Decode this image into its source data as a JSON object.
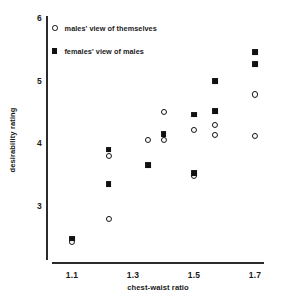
{
  "chart_data": {
    "type": "scatter",
    "title": "",
    "xlabel": "chest-waist ratio",
    "ylabel": "desirability rating",
    "xlim": [
      1.02,
      1.79
    ],
    "ylim": [
      2.1,
      6.0
    ],
    "xticks": [
      "1.1",
      "1.3",
      "1.5",
      "1.7"
    ],
    "xtick_values": [
      1.1,
      1.3,
      1.5,
      1.7
    ],
    "yticks": [
      "3",
      "4",
      "5",
      "6"
    ],
    "ytick_values": [
      3,
      4,
      5,
      6
    ],
    "grid": false,
    "legend_position": "top-left",
    "series": [
      {
        "name": "males' view of themselves",
        "marker": "open-circle",
        "color": "#111111",
        "points": [
          {
            "x": 1.1,
            "y": 2.42
          },
          {
            "x": 1.22,
            "y": 3.8
          },
          {
            "x": 1.22,
            "y": 2.8
          },
          {
            "x": 1.35,
            "y": 4.05
          },
          {
            "x": 1.4,
            "y": 4.5
          },
          {
            "x": 1.4,
            "y": 4.05
          },
          {
            "x": 1.5,
            "y": 4.22
          },
          {
            "x": 1.5,
            "y": 3.48
          },
          {
            "x": 1.57,
            "y": 4.3
          },
          {
            "x": 1.57,
            "y": 4.14
          },
          {
            "x": 1.7,
            "y": 4.78
          },
          {
            "x": 1.7,
            "y": 4.12
          }
        ]
      },
      {
        "name": "females' view of males",
        "marker": "filled-square",
        "color": "#111111",
        "points": [
          {
            "x": 1.1,
            "y": 2.48
          },
          {
            "x": 1.22,
            "y": 3.9
          },
          {
            "x": 1.22,
            "y": 3.35
          },
          {
            "x": 1.35,
            "y": 3.65
          },
          {
            "x": 1.4,
            "y": 4.15
          },
          {
            "x": 1.5,
            "y": 4.46
          },
          {
            "x": 1.5,
            "y": 3.52
          },
          {
            "x": 1.57,
            "y": 5.0
          },
          {
            "x": 1.57,
            "y": 4.52
          },
          {
            "x": 1.7,
            "y": 5.45
          },
          {
            "x": 1.7,
            "y": 5.26
          }
        ]
      }
    ]
  },
  "legend": {
    "items": [
      {
        "label": "males' view of themselves",
        "marker": "open-circle"
      },
      {
        "label": "females' view of males",
        "marker": "filled-square"
      }
    ]
  },
  "axes": {
    "x_title": "chest-waist ratio",
    "y_title": "desirability rating"
  }
}
